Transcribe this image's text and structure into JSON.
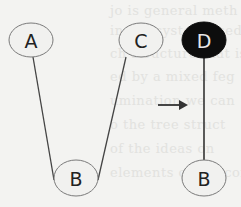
{
  "diagram": {
    "title": "",
    "colors": {
      "background": "#f3f3f1",
      "node_fill": "#f1f1ef",
      "node_stroke": "#777777",
      "node_text": "#222222",
      "highlight_fill": "#0d0d0d",
      "highlight_text": "#e8e8e8",
      "edge": "#444444",
      "arrow": "#333333"
    },
    "left_tree": {
      "nodes": [
        {
          "id": "A",
          "label": "A",
          "cx": 31,
          "cy": 40,
          "filled": false
        },
        {
          "id": "C",
          "label": "C",
          "cx": 141,
          "cy": 40,
          "filled": false
        },
        {
          "id": "B",
          "label": "B",
          "cx": 76,
          "cy": 178,
          "filled": false
        }
      ],
      "edges": [
        {
          "from": "A",
          "to": "B"
        },
        {
          "from": "C",
          "to": "B"
        }
      ]
    },
    "arrow": {
      "label": "",
      "direction": "right"
    },
    "right_tree": {
      "nodes": [
        {
          "id": "D",
          "label": "D",
          "cx": 204,
          "cy": 40,
          "filled": true
        },
        {
          "id": "B2",
          "label": "B",
          "cx": 204,
          "cy": 178,
          "filled": false
        }
      ],
      "edges": [
        {
          "from": "D",
          "to": "B2"
        }
      ]
    }
  },
  "labels": {
    "node_a": "A",
    "node_c": "C",
    "node_b_left": "B",
    "node_d": "D",
    "node_b_right": "B"
  },
  "background_text": [
    "jo is general meth",
    "in the system used",
    "ch structure that is",
    "ed by a mixed feg",
    "umination we can",
    "o the tree struct",
    "of the ideas on",
    "elements of the conte"
  ]
}
